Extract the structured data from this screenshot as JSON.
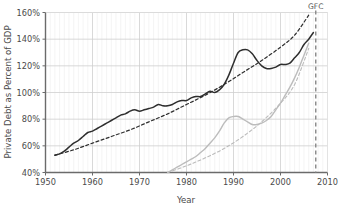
{
  "chart_data": {
    "type": "line",
    "title": "",
    "xlabel": "Year",
    "ylabel": "Private Debt as Percent of GDP",
    "xlim": [
      1950,
      2010
    ],
    "ylim": [
      40,
      160
    ],
    "xticks": [
      1950,
      1960,
      1970,
      1980,
      1990,
      2000,
      2010
    ],
    "xtick_labels": [
      "1950",
      "1960",
      "1970",
      "1980",
      "1990",
      "2000",
      "2010"
    ],
    "yticks": [
      40,
      60,
      80,
      100,
      120,
      140,
      160
    ],
    "ytick_labels": [
      "40%",
      "60%",
      "80%",
      "100%",
      "120%",
      "140%",
      "160%"
    ],
    "grid": true,
    "minor_grid_x": true,
    "legend": null,
    "annotations": [
      {
        "name": "gfc-marker",
        "label": "GFC",
        "x": 2007.5,
        "style": "dashed-vertical-line",
        "color": "#888888"
      }
    ],
    "series": [
      {
        "name": "private-debt-actual",
        "label": "Private Debt (actual)",
        "color": "#2e2e2e",
        "style": "solid",
        "width": 1.5,
        "x": [
          1952,
          1953,
          1954,
          1955,
          1956,
          1957,
          1958,
          1959,
          1960,
          1961,
          1962,
          1963,
          1964,
          1965,
          1966,
          1967,
          1968,
          1969,
          1970,
          1971,
          1972,
          1973,
          1974,
          1975,
          1976,
          1977,
          1978,
          1979,
          1980,
          1981,
          1982,
          1983,
          1984,
          1985,
          1986,
          1987,
          1988,
          1989,
          1990,
          1991,
          1992,
          1993,
          1994,
          1995,
          1996,
          1997,
          1998,
          1999,
          2000,
          2001,
          2002,
          2003,
          2004,
          2005,
          2006,
          2007
        ],
        "y": [
          53,
          54,
          56,
          59,
          62,
          64,
          67,
          70,
          71,
          73,
          75,
          77,
          79,
          81,
          83,
          84,
          86,
          87,
          86,
          87,
          88,
          89,
          91,
          90,
          90,
          91,
          93,
          94,
          94,
          96,
          97,
          97,
          99,
          101,
          100,
          102,
          106,
          113,
          122,
          130,
          132,
          132,
          129,
          124,
          120,
          118,
          118,
          119,
          121,
          121,
          122,
          126,
          130,
          136,
          140,
          145
        ]
      },
      {
        "name": "private-debt-exponential-trend",
        "label": "Exponential trend (private debt)",
        "color": "#2e2e2e",
        "style": "dashed",
        "width": 1.2,
        "x": [
          1952,
          1956,
          1960,
          1964,
          1968,
          1972,
          1976,
          1980,
          1984,
          1988,
          1992,
          1996,
          2000,
          2003,
          2006
        ],
        "y": [
          53,
          57,
          62,
          67,
          72,
          78,
          84,
          91,
          98,
          106,
          115,
          124,
          134,
          143,
          158
        ]
      },
      {
        "name": "secondary-debt-actual",
        "label": "Secondary series (actual)",
        "color": "#bcbcbc",
        "style": "solid",
        "width": 1.4,
        "x": [
          1976,
          1977,
          1978,
          1979,
          1980,
          1981,
          1982,
          1983,
          1984,
          1985,
          1986,
          1987,
          1988,
          1989,
          1990,
          1991,
          1992,
          1993,
          1994,
          1995,
          1996,
          1997,
          1998,
          1999,
          2000,
          2001,
          2002,
          2003,
          2004,
          2005,
          2006
        ],
        "y": [
          40,
          42,
          44,
          46,
          48,
          50,
          52,
          55,
          58,
          62,
          66,
          71,
          77,
          81,
          82,
          82,
          80,
          78,
          76,
          76,
          77,
          79,
          82,
          87,
          92,
          98,
          104,
          111,
          119,
          128,
          137
        ]
      },
      {
        "name": "secondary-debt-exponential-trend",
        "label": "Exponential trend (secondary)",
        "color": "#bcbcbc",
        "style": "dashed",
        "width": 1.1,
        "x": [
          1976,
          1980,
          1984,
          1988,
          1992,
          1996,
          2000,
          2003,
          2006
        ],
        "y": [
          40,
          45,
          51,
          58,
          67,
          78,
          92,
          106,
          133
        ]
      }
    ]
  },
  "axis": {
    "x_label": "Year",
    "y_label": "Private Debt as Percent of GDP"
  }
}
